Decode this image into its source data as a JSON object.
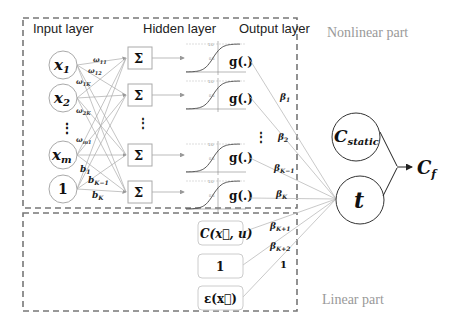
{
  "headers": {
    "input_layer": "Input layer",
    "hidden_layer": "Hidden layer",
    "output_layer": "Output layer"
  },
  "regions": {
    "nonlinear": "Nonlinear part",
    "linear": "Linear part"
  },
  "inputs": [
    {
      "base": "x",
      "sub": "1"
    },
    {
      "base": "x",
      "sub": "2"
    },
    {
      "base": "x",
      "sub": "m"
    },
    {
      "base": "1",
      "sub": ""
    }
  ],
  "hidden_symbol": "Σ",
  "activation": "g(.)",
  "sigmoid_ticks": {
    "top": "1.0",
    "mid": "0.5"
  },
  "weights": {
    "w11": {
      "base": "ω",
      "sub": "11"
    },
    "w12": {
      "base": "ω",
      "sub": "12"
    },
    "w1K": {
      "base": "ω",
      "sub": "1K"
    },
    "w2K": {
      "base": "ω",
      "sub": "2K"
    },
    "wm1": {
      "base": "ω",
      "sub": "m1"
    },
    "b1": {
      "base": "b",
      "sub": "1"
    },
    "bK1": {
      "base": "b",
      "sub": "K−1"
    },
    "bK": {
      "base": "b",
      "sub": "K"
    }
  },
  "betas": [
    {
      "base": "β",
      "sub": "1"
    },
    {
      "base": "β",
      "sub": "2"
    },
    {
      "base": "β",
      "sub": "K−1"
    },
    {
      "base": "β",
      "sub": "K"
    },
    {
      "base": "β",
      "sub": "K+1"
    },
    {
      "base": "β",
      "sub": "K+2"
    }
  ],
  "linear_one_weight": "1",
  "linear_terms": [
    {
      "label": "C(x⃗, u)"
    },
    {
      "label": "1"
    },
    {
      "label": "ε(x⃗)"
    }
  ],
  "right_nodes": {
    "c_static": {
      "base": "C",
      "sub": "static"
    },
    "t": "t",
    "output": {
      "base": "C",
      "sub": "f"
    }
  },
  "ellipsis": "⋮"
}
